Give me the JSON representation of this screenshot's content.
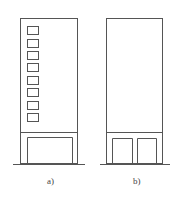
{
  "figure": {
    "panels": [
      {
        "label": "a)",
        "description": "Tall building elevation with a column of 8 small windows and a single wide ground-floor opening",
        "window_count": 8,
        "door_count": 1
      },
      {
        "label": "b)",
        "description": "Tall building elevation with blank upper facade and two ground-floor openings",
        "window_count": 0,
        "door_count": 2
      }
    ],
    "line_color": "#555555"
  }
}
